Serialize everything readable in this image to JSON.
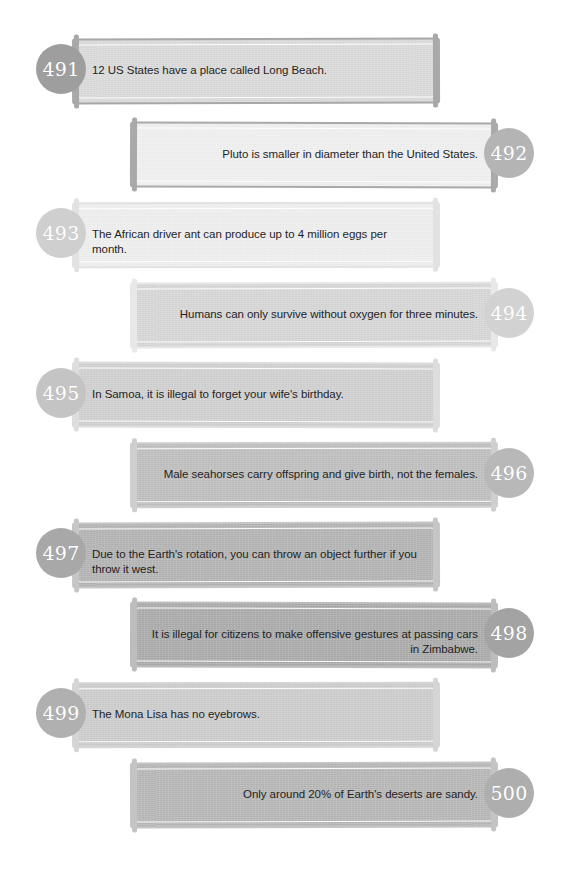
{
  "page": {
    "background": "#ffffff",
    "width": 569,
    "height": 872
  },
  "facts": [
    {
      "number": "491",
      "text": "12 US States have a place called Long Beach.",
      "align": "left",
      "bar_color": "#d9d9d9",
      "border_color": "#a8a8a8",
      "badge_color": "#9e9e9e",
      "bar": {
        "x": 72,
        "y": 38,
        "w": 368,
        "h": 66
      },
      "badge": {
        "x": 36,
        "y": 44,
        "size": 50
      },
      "text_box": {
        "x": 92,
        "y": 63,
        "w": 330
      }
    },
    {
      "number": "492",
      "text": "Pluto is smaller in diameter than the United States.",
      "align": "right",
      "bar_color": "#efefef",
      "border_color": "#a9a9a9",
      "badge_color": "#b4b4b4",
      "bar": {
        "x": 130,
        "y": 122,
        "w": 368,
        "h": 66
      },
      "badge": {
        "x": 484,
        "y": 128,
        "size": 50
      },
      "text_box": {
        "x": 148,
        "y": 147,
        "w": 330
      }
    },
    {
      "number": "493",
      "text": "The African driver ant can produce up to 4 million eggs per month.",
      "align": "left",
      "bar_color": "#eeeeee",
      "border_color": "#e2e2e2",
      "badge_color": "#cfcfcf",
      "bar": {
        "x": 72,
        "y": 202,
        "w": 368,
        "h": 66
      },
      "badge": {
        "x": 36,
        "y": 208,
        "size": 50
      },
      "text_box": {
        "x": 92,
        "y": 227,
        "w": 330
      }
    },
    {
      "number": "494",
      "text": "Humans can only survive without oxygen for three minutes.",
      "align": "right",
      "bar_color": "#d5d5d5",
      "border_color": "#e8e8e8",
      "badge_color": "#d2d2d2",
      "bar": {
        "x": 130,
        "y": 282,
        "w": 368,
        "h": 66
      },
      "badge": {
        "x": 484,
        "y": 288,
        "size": 50
      },
      "text_box": {
        "x": 148,
        "y": 307,
        "w": 330
      }
    },
    {
      "number": "495",
      "text": "In Samoa, it is illegal to forget your wife's birthday.",
      "align": "left",
      "bar_color": "#cfcfcf",
      "border_color": "#dddddd",
      "badge_color": "#c4c4c4",
      "bar": {
        "x": 72,
        "y": 362,
        "w": 368,
        "h": 66
      },
      "badge": {
        "x": 36,
        "y": 368,
        "size": 50
      },
      "text_box": {
        "x": 92,
        "y": 387,
        "w": 330
      }
    },
    {
      "number": "496",
      "text": "Male seahorses carry offspring and give birth, not the females.",
      "align": "right",
      "bar_color": "#bdbdbd",
      "border_color": "#cfcfcf",
      "badge_color": "#b8b8b8",
      "bar": {
        "x": 130,
        "y": 442,
        "w": 368,
        "h": 66
      },
      "badge": {
        "x": 484,
        "y": 448,
        "size": 50
      },
      "text_box": {
        "x": 148,
        "y": 467,
        "w": 330
      }
    },
    {
      "number": "497",
      "text": "Due to the Earth's rotation, you can throw an object further if you throw it west.",
      "align": "left",
      "bar_color": "#b2b2b2",
      "border_color": "#c6c6c6",
      "badge_color": "#a8a8a8",
      "bar": {
        "x": 72,
        "y": 522,
        "w": 368,
        "h": 66
      },
      "badge": {
        "x": 36,
        "y": 528,
        "size": 50
      },
      "text_box": {
        "x": 92,
        "y": 547,
        "w": 330
      }
    },
    {
      "number": "498",
      "text": "It is illegal for citizens to make offensive gestures at passing cars in Zimbabwe.",
      "align": "right",
      "bar_color": "#a9a9a9",
      "border_color": "#bdbdbd",
      "badge_color": "#a3a3a3",
      "bar": {
        "x": 130,
        "y": 602,
        "w": 368,
        "h": 66
      },
      "badge": {
        "x": 484,
        "y": 608,
        "size": 50
      },
      "text_box": {
        "x": 148,
        "y": 627,
        "w": 330
      }
    },
    {
      "number": "499",
      "text": "The Mona Lisa has no eyebrows.",
      "align": "left",
      "bar_color": "#cbcbcb",
      "border_color": "#d5d5d5",
      "badge_color": "#b0b0b0",
      "bar": {
        "x": 72,
        "y": 682,
        "w": 368,
        "h": 66
      },
      "badge": {
        "x": 36,
        "y": 688,
        "size": 50
      },
      "text_box": {
        "x": 92,
        "y": 707,
        "w": 330
      }
    },
    {
      "number": "500",
      "text": "Only around 20% of Earth's deserts are sandy.",
      "align": "right",
      "bar_color": "#b5b5b5",
      "border_color": "#c4c4c4",
      "badge_color": "#aeaeae",
      "bar": {
        "x": 130,
        "y": 762,
        "w": 368,
        "h": 66
      },
      "badge": {
        "x": 484,
        "y": 768,
        "size": 50
      },
      "text_box": {
        "x": 148,
        "y": 787,
        "w": 330
      }
    }
  ]
}
